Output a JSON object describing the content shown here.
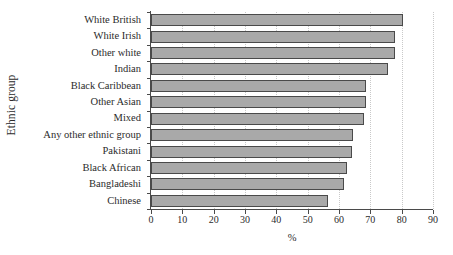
{
  "chart_data": {
    "type": "bar",
    "orientation": "horizontal",
    "title": "",
    "xlabel": "%",
    "ylabel": "Ethnic group",
    "xlim": [
      0,
      90
    ],
    "xticks": [
      0,
      10,
      20,
      30,
      40,
      50,
      60,
      70,
      80,
      90
    ],
    "grid": true,
    "legend": false,
    "categories": [
      "White British",
      "White Irish",
      "Other white",
      "Indian",
      "Black Caribbean",
      "Other Asian",
      "Mixed",
      "Any other ethnic group",
      "Pakistani",
      "Black African",
      "Bangladeshi",
      "Chinese"
    ],
    "values": [
      80.5,
      78,
      78,
      75.5,
      68.5,
      68.5,
      68,
      64.5,
      64,
      62.5,
      61.5,
      56.5
    ]
  },
  "style": {
    "bar_fill": "#a9a9a9",
    "bar_border": "#4a4a4a",
    "axis_color": "#4a4a4a",
    "grid_color": "#c9c9c9",
    "text_color": "#2b2b2b",
    "background": "#ffffff"
  }
}
